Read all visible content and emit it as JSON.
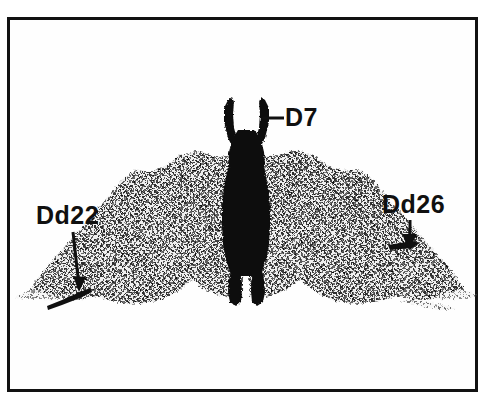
{
  "figure": {
    "kind": "scientific-specimen-illustration",
    "background_color": "#ffffff",
    "frame": {
      "border_color": "#121212",
      "border_width_px": 3,
      "x": 7,
      "y": 17,
      "width": 471,
      "height": 375
    },
    "colors": {
      "ink_black": "#101010",
      "body_black": "#0c0c0c",
      "wing_gray": "#8d8d8d",
      "wing_gray_dark": "#5a5a5a",
      "wing_gray_light": "#b6b6b6",
      "paper_white": "#ffffff"
    },
    "labels": [
      {
        "id": "d7",
        "text": "D7",
        "x": 285,
        "y": 105,
        "font_size": 25,
        "leader": {
          "type": "line",
          "from_x": 262,
          "from_y": 118,
          "to_x": 283,
          "to_y": 118
        }
      },
      {
        "id": "dd22",
        "text": "Dd22",
        "x": 36,
        "y": 203,
        "font_size": 25,
        "leader": {
          "type": "arrow",
          "from_x": 73,
          "from_y": 232,
          "to_x": 79,
          "to_y": 288,
          "direction": "down"
        }
      },
      {
        "id": "dd26",
        "text": "Dd26",
        "x": 382,
        "y": 192,
        "font_size": 25,
        "leader": {
          "type": "arrow",
          "from_x": 410,
          "from_y": 220,
          "to_x": 410,
          "to_y": 250,
          "direction": "down"
        }
      }
    ],
    "body": {
      "description": "solid black central moth body with two raised antennae at top, thick thorax/abdomen, and two legs at bottom",
      "center_x": 246,
      "top_y": 96,
      "bottom_y": 305
    },
    "wings": {
      "description": "symmetric dithered gray wings spread left and right from the body, ragged lower margins, tapering to thin tips",
      "left_tip_x": 30,
      "right_tip_x": 462,
      "top_y": 152,
      "bottom_y": 310
    }
  }
}
